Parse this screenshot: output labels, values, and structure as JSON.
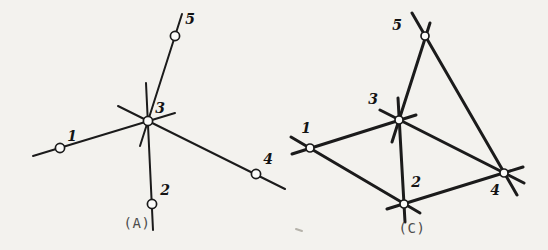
{
  "page": {
    "background": "#f3f2ee",
    "ink": "#1b1b1b",
    "node_fill": "#fbfbf9",
    "label_color": "#141414",
    "caption_color": "#4d4d4d",
    "artifact_color": "#b5b2aa"
  },
  "figures": [
    {
      "name": "A",
      "caption": "(A)",
      "caption_x": 137,
      "caption_y": 223,
      "stroke_width": 2,
      "node_radius": 4.6,
      "nodes": [
        {
          "id": "1",
          "x": 60,
          "y": 148,
          "label_x": 72,
          "label_y": 136
        },
        {
          "id": "2",
          "x": 152,
          "y": 204,
          "label_x": 165,
          "label_y": 190
        },
        {
          "id": "3",
          "x": 148,
          "y": 121,
          "label_x": 160,
          "label_y": 108
        },
        {
          "id": "4",
          "x": 256,
          "y": 174,
          "label_x": 268,
          "label_y": 159
        },
        {
          "id": "5",
          "x": 175,
          "y": 36,
          "label_x": 190,
          "label_y": 19
        }
      ],
      "edges": [
        {
          "from": "1",
          "to": "3",
          "x1": 33,
          "y1": 156,
          "x2": 175,
          "y2": 113
        },
        {
          "from": "3",
          "to": "2",
          "x1": 146,
          "y1": 83,
          "x2": 153,
          "y2": 230
        },
        {
          "from": "3",
          "to": "4",
          "x1": 118,
          "y1": 106,
          "x2": 285,
          "y2": 189
        },
        {
          "from": "5",
          "to": "3",
          "x1": 182,
          "y1": 14,
          "x2": 140,
          "y2": 146
        }
      ]
    },
    {
      "name": "C",
      "caption": "(C)",
      "caption_x": 412,
      "caption_y": 228,
      "stroke_width": 3,
      "node_radius": 4,
      "nodes": [
        {
          "id": "1",
          "x": 310,
          "y": 148,
          "label_x": 306,
          "label_y": 128
        },
        {
          "id": "2",
          "x": 404,
          "y": 204,
          "label_x": 416,
          "label_y": 182
        },
        {
          "id": "3",
          "x": 399,
          "y": 120,
          "label_x": 373,
          "label_y": 99
        },
        {
          "id": "4",
          "x": 504,
          "y": 173,
          "label_x": 495,
          "label_y": 190
        },
        {
          "id": "5",
          "x": 425,
          "y": 36,
          "label_x": 397,
          "label_y": 25
        }
      ],
      "edges": [
        {
          "from": "1",
          "to": "3",
          "x1": 292,
          "y1": 154,
          "x2": 416,
          "y2": 115
        },
        {
          "from": "1",
          "to": "2",
          "x1": 291,
          "y1": 137,
          "x2": 420,
          "y2": 213
        },
        {
          "from": "3",
          "to": "2",
          "x1": 398,
          "y1": 98,
          "x2": 405,
          "y2": 222
        },
        {
          "from": "3",
          "to": "4",
          "x1": 380,
          "y1": 110,
          "x2": 524,
          "y2": 183
        },
        {
          "from": "5",
          "to": "3",
          "x1": 430,
          "y1": 23,
          "x2": 392,
          "y2": 142
        },
        {
          "from": "2",
          "to": "4",
          "x1": 387,
          "y1": 209,
          "x2": 523,
          "y2": 167
        },
        {
          "from": "5",
          "to": "4",
          "x1": 412,
          "y1": 13,
          "x2": 517,
          "y2": 195
        }
      ]
    }
  ],
  "artifact": {
    "x1": 296,
    "y1": 229,
    "x2": 302,
    "y2": 231
  }
}
